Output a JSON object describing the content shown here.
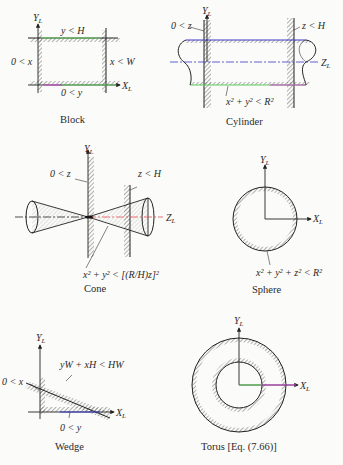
{
  "figure": {
    "panels": [
      {
        "id": "block",
        "caption": "Block",
        "axes": {
          "y": "Y",
          "y_sub": "L",
          "x": "X",
          "x_sub": "L"
        },
        "constraints": [
          "y < H",
          "0 < x",
          "x < W",
          "0 < y"
        ]
      },
      {
        "id": "cylinder",
        "caption": "Cylinder",
        "axes": {
          "y": "Y",
          "y_sub": "L",
          "z": "Z",
          "z_sub": "L"
        },
        "constraints": [
          "0 < z",
          "z < H",
          "x² + y² < R²"
        ]
      },
      {
        "id": "cone",
        "caption": "Cone",
        "axes": {
          "y": "Y",
          "y_sub": "L",
          "z": "Z",
          "z_sub": "L"
        },
        "constraints": [
          "0 < z",
          "z < H",
          "x² + y² < [(R/H)z]²"
        ]
      },
      {
        "id": "sphere",
        "caption": "Sphere",
        "axes": {
          "y": "Y",
          "y_sub": "L",
          "x": "X",
          "x_sub": "L"
        },
        "constraints": [
          "x² + y² + z² < R²"
        ]
      },
      {
        "id": "wedge",
        "caption": "Wedge",
        "axes": {
          "y": "Y",
          "y_sub": "L",
          "x": "X",
          "x_sub": "L"
        },
        "constraints": [
          "yW + xH < HW",
          "0 < x",
          "0 < y"
        ]
      },
      {
        "id": "torus",
        "caption": "Torus [Eq. (7.66)]",
        "axes": {
          "y": "Y",
          "y_sub": "L",
          "x": "X",
          "x_sub": "L"
        },
        "constraints": []
      }
    ],
    "colors": {
      "ink": "#222222",
      "hatch": "#555555",
      "background": "#fbfbf9",
      "highlight_green": "#5ccc5c",
      "highlight_blue": "#3a3acc",
      "highlight_magenta": "#cc44cc",
      "highlight_red": "#e05050"
    }
  }
}
